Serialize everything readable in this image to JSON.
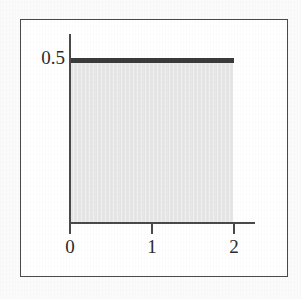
{
  "figure": {
    "kind": "uniform-probability-density-plot",
    "frame_border_color": "#4a4a4a",
    "background_color": "#fbfbfb",
    "plot_background_color": "#ffffff"
  },
  "chart_data": {
    "type": "area",
    "title": "",
    "subtitle": "",
    "xlabel": "",
    "ylabel": "",
    "x": [
      0,
      2
    ],
    "values": [
      0.5,
      0.5
    ],
    "series": [
      {
        "name": "uniform density on [0,2]",
        "x": [
          0,
          2
        ],
        "values": [
          0.5,
          0.5
        ],
        "line_color": "#3b3b3b",
        "fill_color": "#e6e6e6",
        "line_width_px": 4.5
      }
    ],
    "xlim": [
      0,
      2.35
    ],
    "ylim": [
      0,
      0.59
    ],
    "x_ticks": [
      0,
      1,
      2
    ],
    "x_tick_labels": [
      "0",
      "1",
      "2"
    ],
    "y_ticks": [
      0.5
    ],
    "y_tick_labels": [
      "0.5"
    ],
    "grid": false,
    "legend": null,
    "annotations": []
  },
  "axes": {
    "y_label_value": "0.5",
    "x_labels": [
      "0",
      "1",
      "2"
    ],
    "axis_color": "#4a4a4a",
    "tick_color": "#4a4a4a"
  }
}
